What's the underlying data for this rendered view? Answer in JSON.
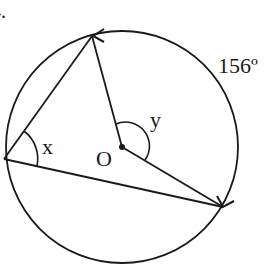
{
  "problem": {
    "number_label": "4."
  },
  "diagram": {
    "stroke_color": "#1a1a1a",
    "background_color": "#ffffff",
    "circle": {
      "cx": 122,
      "cy": 147,
      "r": 116
    },
    "center_label": "O",
    "points": {
      "top": {
        "x": 92,
        "y": 36
      },
      "left": {
        "x": 4,
        "y": 159
      },
      "right": {
        "x": 223,
        "y": 207
      },
      "center": {
        "x": 122,
        "y": 147
      }
    },
    "angle_labels": {
      "inscribed": "x",
      "central": "y"
    },
    "arc_label": "156º"
  }
}
